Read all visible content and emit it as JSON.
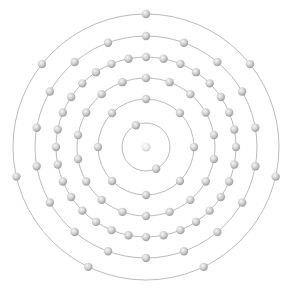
{
  "diagram": {
    "type": "bohr-model-electron-shells",
    "center": [
      146,
      147
    ],
    "nucleus": {
      "radius": 4.5,
      "color": "#e6e6e6"
    },
    "electron": {
      "radius": 4.2,
      "color": "#bdbdbd",
      "highlight": "#f4f4f4"
    },
    "orbit_color": "#a8a8a8",
    "shells": [
      {
        "index": 1,
        "radius": 24,
        "electrons": 2,
        "start_angle": -115
      },
      {
        "index": 2,
        "radius": 48,
        "electrons": 8,
        "start_angle": -90
      },
      {
        "index": 3,
        "radius": 69,
        "electrons": 18,
        "start_angle": -90
      },
      {
        "index": 4,
        "radius": 90,
        "electrons": 32,
        "start_angle": -90
      },
      {
        "index": 5,
        "radius": 111,
        "electrons": 18,
        "start_angle": -90
      },
      {
        "index": 6,
        "radius": 133,
        "electrons": 7,
        "start_angle": -90
      }
    ],
    "electron_configuration": [
      2,
      8,
      18,
      32,
      18,
      7
    ],
    "total_electrons": 85
  }
}
